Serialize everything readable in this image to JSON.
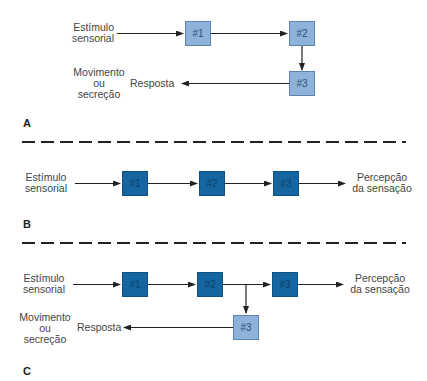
{
  "colors": {
    "light_box": "#8db3da",
    "dark_box": "#1566a0",
    "arrow": "#222222",
    "divider": "#222222"
  },
  "panels": {
    "A": {
      "letter": "A",
      "input_label_line1": "Estímulo",
      "input_label_line2": "sensorial",
      "boxes": [
        "#1",
        "#2",
        "#3"
      ],
      "response_label": "Resposta",
      "output_line1": "Movimento",
      "output_line2": "ou",
      "output_line3": "secreção"
    },
    "B": {
      "letter": "B",
      "input_label_line1": "Estímulo",
      "input_label_line2": "sensorial",
      "boxes": [
        "#1",
        "#2",
        "#3"
      ],
      "output_line1": "Percepção",
      "output_line2": "da sensação"
    },
    "C": {
      "letter": "C",
      "input_label_line1": "Estímulo",
      "input_label_line2": "sensorial",
      "boxes": [
        "#1",
        "#2",
        "#3"
      ],
      "branch_box": "#3",
      "perception_line1": "Percepção",
      "perception_line2": "da sensação",
      "response_label": "Resposta",
      "output_line1": "Movimento",
      "output_line2": "ou",
      "output_line3": "secreção"
    }
  }
}
